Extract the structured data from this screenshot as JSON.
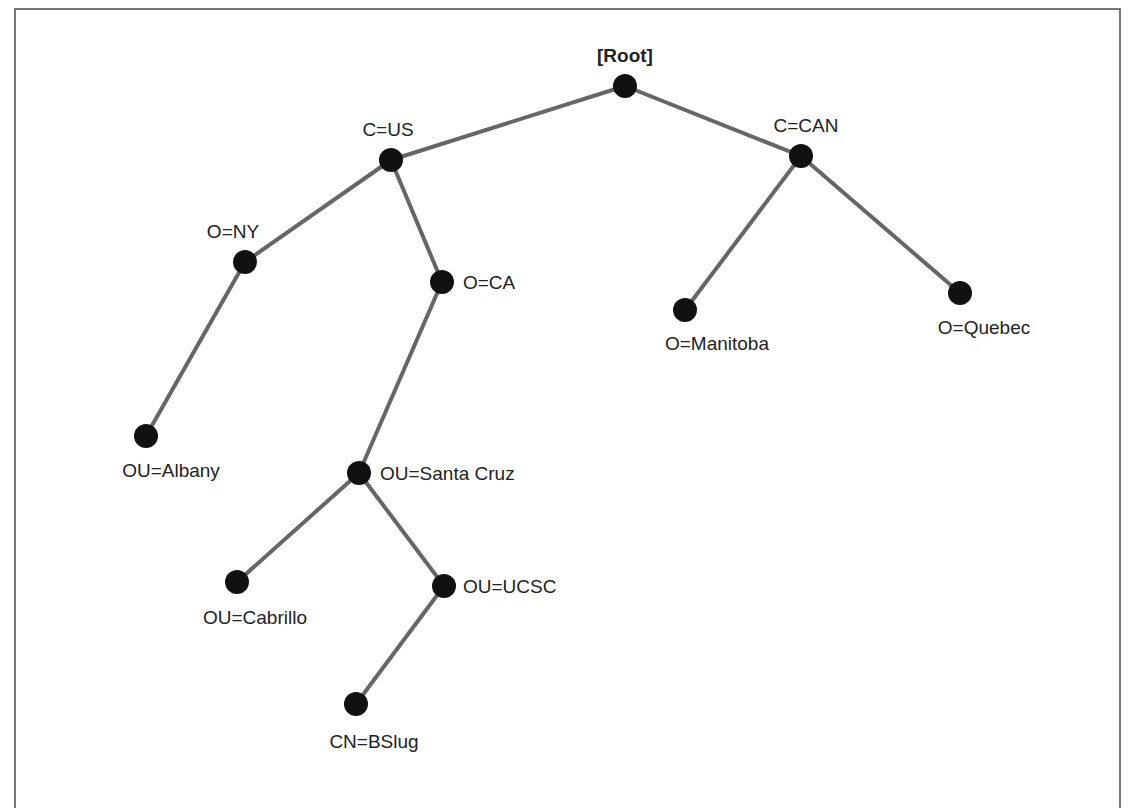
{
  "diagram": {
    "colors": {
      "edge": "#666666",
      "node": "#111111",
      "label": "#222222",
      "frame": "#777777"
    },
    "nodes": [
      {
        "id": "root",
        "label": "[Root]",
        "x": 625,
        "y": 86,
        "lx": 625,
        "ly": 62,
        "anchor": "middle"
      },
      {
        "id": "c_us",
        "label": "C=US",
        "x": 391,
        "y": 160,
        "lx": 388,
        "ly": 136,
        "anchor": "middle"
      },
      {
        "id": "c_can",
        "label": "C=CAN",
        "x": 801,
        "y": 156,
        "lx": 806,
        "ly": 132,
        "anchor": "middle"
      },
      {
        "id": "o_ny",
        "label": "O=NY",
        "x": 245,
        "y": 262,
        "lx": 233,
        "ly": 238,
        "anchor": "middle"
      },
      {
        "id": "o_ca",
        "label": "O=CA",
        "x": 442,
        "y": 282,
        "lx": 463,
        "ly": 289,
        "anchor": "start"
      },
      {
        "id": "o_manitoba",
        "label": "O=Manitoba",
        "x": 685,
        "y": 310,
        "lx": 717,
        "ly": 350,
        "anchor": "middle"
      },
      {
        "id": "o_quebec",
        "label": "O=Quebec",
        "x": 960,
        "y": 293,
        "lx": 984,
        "ly": 334,
        "anchor": "middle"
      },
      {
        "id": "ou_albany",
        "label": "OU=Albany",
        "x": 146,
        "y": 436,
        "lx": 171,
        "ly": 477,
        "anchor": "middle"
      },
      {
        "id": "ou_santacruz",
        "label": "OU=Santa Cruz",
        "x": 359,
        "y": 473,
        "lx": 380,
        "ly": 480,
        "anchor": "start"
      },
      {
        "id": "ou_cabrillo",
        "label": "OU=Cabrillo",
        "x": 237,
        "y": 582,
        "lx": 255,
        "ly": 624,
        "anchor": "middle"
      },
      {
        "id": "ou_ucsc",
        "label": "OU=UCSC",
        "x": 444,
        "y": 586,
        "lx": 463,
        "ly": 593,
        "anchor": "start"
      },
      {
        "id": "cn_bslug",
        "label": "CN=BSlug",
        "x": 356,
        "y": 704,
        "lx": 374,
        "ly": 748,
        "anchor": "middle"
      }
    ],
    "edges": [
      {
        "from": "root",
        "to": "c_us"
      },
      {
        "from": "root",
        "to": "c_can"
      },
      {
        "from": "c_us",
        "to": "o_ny"
      },
      {
        "from": "c_us",
        "to": "o_ca"
      },
      {
        "from": "o_ny",
        "to": "ou_albany"
      },
      {
        "from": "o_ca",
        "to": "ou_santacruz"
      },
      {
        "from": "ou_santacruz",
        "to": "ou_cabrillo"
      },
      {
        "from": "ou_santacruz",
        "to": "ou_ucsc"
      },
      {
        "from": "ou_ucsc",
        "to": "cn_bslug"
      },
      {
        "from": "c_can",
        "to": "o_manitoba"
      },
      {
        "from": "c_can",
        "to": "o_quebec"
      }
    ]
  }
}
